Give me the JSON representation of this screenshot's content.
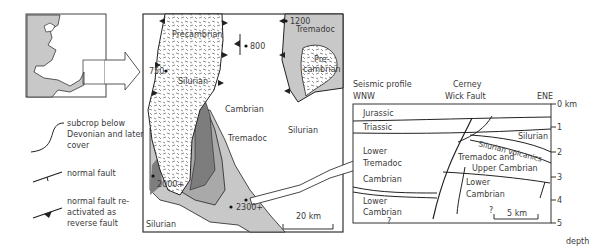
{
  "inset_map": {
    "description": "Wales and south-west England outline"
  },
  "legend": {
    "items": [
      {
        "symbol": "curve-line",
        "label": "subcrop below Devonian and later cover"
      },
      {
        "symbol": "normal-fault",
        "label": "normal fault"
      },
      {
        "symbol": "reverse-fault",
        "label": "normal fault re-activated as reverse fault"
      }
    ]
  },
  "map": {
    "units": {
      "precambrian_main": "Precambrian",
      "silurian_inlier": "Silurian",
      "precambrian_east": "Pre-\ncambrian",
      "tremadoc_east": "Tremadoc",
      "cambrian": "Cambrian",
      "tremadoc": "Tremadoc",
      "silurian_east": "Silurian",
      "silurian_sw": "Silurian"
    },
    "wells": [
      "750",
      "800",
      "1200",
      "2000+",
      "2300+"
    ],
    "scale_bar": "20 km",
    "colors": {
      "light_gray": "#c8c8c8",
      "mid_gray": "#a9a9a9",
      "dark_gray": "#7d7d7d",
      "white": "#ffffff",
      "line": "#222222"
    }
  },
  "profile": {
    "title": "Seismic profile",
    "west": "WNW",
    "east": "ENE",
    "fault_label_1": "Cerney",
    "fault_label_2": "Wick Fault",
    "units": {
      "jurassic": "Jurassic",
      "triassic": "Triassic",
      "lower_tremadoc_1": "Lower",
      "lower_tremadoc_2": "Tremadoc",
      "cambrian": "Cambrian",
      "lower_cambrian_w1": "Lower",
      "lower_cambrian_w2": "Cambrian",
      "q_west": "?",
      "silurian": "Silurian",
      "silurian_volcanics": "Silurian volcanics",
      "tremadoc_upper_1": "Tremadoc and",
      "tremadoc_upper_2": "Upper Cambrian",
      "lower_cambrian_e1": "Lower",
      "lower_cambrian_e2": "Cambrian",
      "q_east": "?"
    },
    "depth_ticks": [
      "0 km",
      "1",
      "2",
      "3",
      "4",
      "5"
    ],
    "depth_label": "depth",
    "scale_bar": "5 km"
  }
}
